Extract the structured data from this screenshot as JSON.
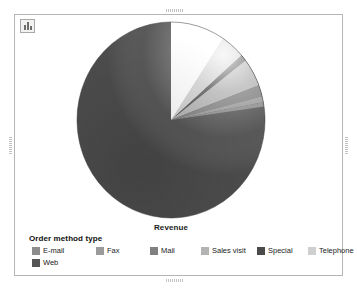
{
  "frame": {
    "toolbar_icon": "bar-chart-icon"
  },
  "axis_label": "Revenue",
  "legend": {
    "title": "Order method type",
    "items": [
      {
        "label": "E-mail",
        "color": "#8d8d8d",
        "x": 3,
        "y": 0
      },
      {
        "label": "Fax",
        "color": "#9a9a9a",
        "x": 67,
        "y": 0
      },
      {
        "label": "Mail",
        "color": "#808080",
        "x": 121,
        "y": 0
      },
      {
        "label": "Sales visit",
        "color": "#b3b3b3",
        "x": 172,
        "y": 0
      },
      {
        "label": "Special",
        "color": "#4a4a4a",
        "x": 228,
        "y": 0
      },
      {
        "label": "Telephone",
        "color": "#cfcfcf",
        "x": 279,
        "y": 0
      },
      {
        "label": "Web",
        "color": "#555555",
        "x": 3,
        "y": 12
      }
    ]
  },
  "chart_data": {
    "type": "pie",
    "title": "",
    "subtitle": "",
    "xlabel": "Revenue",
    "ylabel": "",
    "grid": false,
    "legend_position": "bottom",
    "legend_title": "Order method type",
    "measure": "Revenue",
    "categories": [
      "Web",
      "Telephone",
      "Special",
      "Sales visit",
      "Mail",
      "Fax",
      "E-mail"
    ],
    "values": [
      86.5,
      4.2,
      1.1,
      4.6,
      1.9,
      1.0,
      0.7
    ],
    "value_unit": "percent",
    "slices": [
      {
        "label": "Web",
        "percent": 86.5,
        "color": "#555555",
        "start_angle": 90,
        "end_angle": 401.4
      },
      {
        "label": "Telephone",
        "percent": 4.2,
        "color": "#cfcfcf",
        "start_angle": 41.4,
        "end_angle": 56.5
      },
      {
        "label": "Special",
        "percent": 1.1,
        "color": "#4a4a4a",
        "start_angle": 37.4,
        "end_angle": 41.4
      },
      {
        "label": "Sales visit",
        "percent": 4.6,
        "color": "#b3b3b3",
        "start_angle": 20.8,
        "end_angle": 37.4
      },
      {
        "label": "Mail",
        "percent": 1.9,
        "color": "#808080",
        "start_angle": 14.0,
        "end_angle": 20.8
      },
      {
        "label": "Fax",
        "percent": 1.0,
        "color": "#9a9a9a",
        "start_angle": 10.4,
        "end_angle": 14.0
      },
      {
        "label": "E-mail",
        "percent": 0.7,
        "color": "#8d8d8d",
        "start_angle": 7.9,
        "end_angle": 10.4
      }
    ]
  }
}
